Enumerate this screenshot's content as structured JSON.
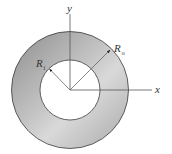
{
  "diagram": {
    "axes": {
      "x_label": "x",
      "y_label": "y"
    },
    "inner_radius": {
      "symbol": "R",
      "subscript": "i"
    },
    "outer_radius": {
      "symbol": "R",
      "subscript": "o"
    },
    "colors": {
      "ring_fill_dark": "#8c8c8c",
      "ring_fill_light": "#d6d6d6",
      "outline": "#3a3a3a",
      "axis": "#555555",
      "background": "#ffffff"
    }
  }
}
